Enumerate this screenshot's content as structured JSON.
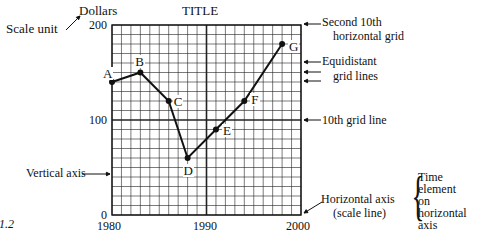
{
  "figure_label": "1.2",
  "chart_data": {
    "type": "line",
    "title": "TITLE",
    "xlabel": "",
    "ylabel": "Dollars",
    "xlim": [
      1980,
      2000
    ],
    "ylim": [
      0,
      200
    ],
    "x_ticks": [
      "1980",
      "1990",
      "2000"
    ],
    "y_ticks": [
      "0",
      "100",
      "200"
    ],
    "grid": true,
    "minor_grid": {
      "x_step": 1,
      "y_step": 10
    },
    "major_grid": {
      "x": [
        1990
      ],
      "y": [
        100
      ]
    },
    "points": [
      {
        "label": "A",
        "x": 1980,
        "y": 140
      },
      {
        "label": "B",
        "x": 1983,
        "y": 150
      },
      {
        "label": "C",
        "x": 1986,
        "y": 120
      },
      {
        "label": "D",
        "x": 1988,
        "y": 60
      },
      {
        "label": "E",
        "x": 1991,
        "y": 90
      },
      {
        "label": "F",
        "x": 1994,
        "y": 120
      },
      {
        "label": "G",
        "x": 1998,
        "y": 180
      }
    ],
    "annotations": [
      {
        "text": "Scale unit",
        "points_to": "Dollars"
      },
      {
        "text": "Second 10th horizontal grid",
        "points_to": "y=200"
      },
      {
        "text": "Equidistant grid lines",
        "points_to": "y=170..150"
      },
      {
        "text": "10th grid line",
        "points_to": "y=100"
      },
      {
        "text": "Vertical axis",
        "points_to": "y-axis"
      },
      {
        "text": "Horizontal axis (scale line)",
        "points_to": "x-axis"
      },
      {
        "text": "Time element on horizontal axis",
        "points_to": "x-axis bracket"
      }
    ]
  },
  "labels": {
    "title": "TITLE",
    "scale_unit": "Scale unit",
    "dollars": "Dollars",
    "y200": "200",
    "y100": "100",
    "y0": "0",
    "x1980": "1980",
    "x1990": "1990",
    "x2000": "2000",
    "second_10th_1": "Second 10th",
    "second_10th_2": "horizontal grid",
    "equidistant_1": "Equidistant",
    "equidistant_2": "grid lines",
    "tenth_grid": "10th grid line",
    "vertical_axis": "Vertical axis",
    "horizontal_axis_1": "Horizontal axis",
    "horizontal_axis_2": "(scale line)",
    "time_1": "Time",
    "time_2": "element",
    "time_3": "on",
    "time_4": "horizontal",
    "time_5": "axis",
    "fig": ".1.2"
  }
}
